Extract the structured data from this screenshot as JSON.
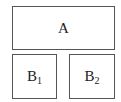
{
  "diagram": {
    "boxes": [
      {
        "id": "A",
        "label": "A",
        "subscript": ""
      },
      {
        "id": "B1",
        "label": "B",
        "subscript": "1"
      },
      {
        "id": "B2",
        "label": "B",
        "subscript": "2"
      }
    ]
  }
}
